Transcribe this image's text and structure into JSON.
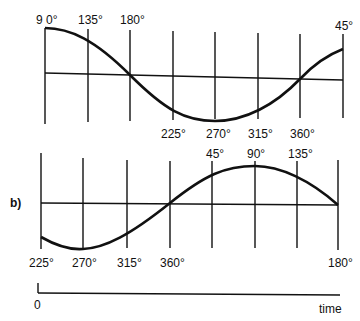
{
  "diagram": {
    "panel_a": {
      "top_labels": [
        "9 0°",
        "135°",
        "180°",
        "45°"
      ],
      "bottom_labels": [
        "225°",
        "270°",
        "315°",
        "360°"
      ]
    },
    "panel_b": {
      "label": "b)",
      "top_labels": [
        "45°",
        "90°",
        "135°"
      ],
      "bottom_labels": [
        "225°",
        "270°",
        "315°",
        "360°",
        "180°"
      ]
    },
    "time_axis": {
      "origin_label": "0",
      "axis_label": "time"
    }
  }
}
